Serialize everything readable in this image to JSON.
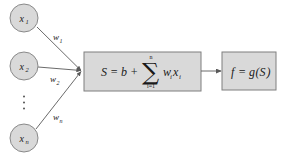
{
  "diagram": {
    "colors": {
      "node_fill": "#d9d9d9",
      "node_stroke": "#7f7f7f",
      "box_fill": "#d9d9d9",
      "box_stroke": "#7f7f7f",
      "edge": "#595959",
      "text": "#1a1a1a",
      "background": "#ffffff"
    },
    "inputs": [
      {
        "id": "x1",
        "base": "x",
        "sub": "1",
        "cx": 24,
        "cy": 18,
        "r": 14
      },
      {
        "id": "x2",
        "base": "x",
        "sub": "2",
        "cx": 24,
        "cy": 66,
        "r": 14
      },
      {
        "id": "xn",
        "base": "x",
        "sub": "n",
        "cx": 24,
        "cy": 138,
        "r": 14
      }
    ],
    "ellipsis": {
      "label": "vertical-ellipsis",
      "cx": 24,
      "cy": 103
    },
    "weights": [
      {
        "id": "w1",
        "base": "w",
        "sub": "1",
        "x": 48,
        "y": 40
      },
      {
        "id": "w2",
        "base": "w",
        "sub": "2",
        "x": 48,
        "y": 82
      },
      {
        "id": "wn",
        "base": "w",
        "sub": "n",
        "x": 48,
        "y": 120
      }
    ],
    "edges": [
      {
        "from": "x1",
        "to": "summation-node",
        "x1": 37,
        "y1": 27,
        "x2": 82,
        "y2": 71
      },
      {
        "from": "x2",
        "to": "summation-node",
        "x1": 38,
        "y1": 67,
        "x2": 82,
        "y2": 71
      },
      {
        "from": "xn",
        "to": "summation-node",
        "x1": 36,
        "y1": 129,
        "x2": 82,
        "y2": 71
      },
      {
        "from": "summation-box",
        "to": "activation-box",
        "x1": 201,
        "y1": 71,
        "x2": 221,
        "y2": 71
      }
    ],
    "summation_box": {
      "label": "summation-box",
      "x": 84,
      "y": 52,
      "width": 117,
      "height": 39,
      "formula_text": "S = b + ∑(i=1..n) wᵢxᵢ",
      "parts": {
        "lhs": "S = b +",
        "sigma": "∑",
        "upper_limit": "n",
        "lower_limit": "i=1",
        "term_w": "w",
        "term_w_sub": "i",
        "term_x": "x",
        "term_x_sub": "i"
      }
    },
    "activation_box": {
      "label": "activation-box",
      "x": 222,
      "y": 52,
      "width": 54,
      "height": 38,
      "formula_text": "f = g(S)",
      "parts": {
        "lhs_f": "f",
        "equals": "=",
        "func_g": "g",
        "open_paren": "(",
        "arg_S": "S",
        "close_paren": ")"
      }
    }
  }
}
